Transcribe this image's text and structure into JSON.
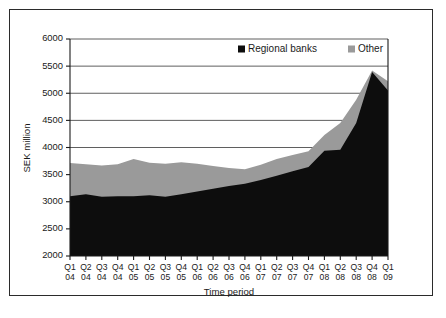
{
  "chart_data": {
    "type": "area",
    "stacked": true,
    "title": "",
    "subtitle": "",
    "xlabel": "Time period",
    "ylabel": "SEK million",
    "ylim": [
      2000,
      6000
    ],
    "ytick_step": 500,
    "yticks": [
      "2000",
      "2500",
      "3000",
      "3500",
      "4000",
      "4500",
      "5000",
      "5500",
      "6000"
    ],
    "grid": "horizontal",
    "legend_position": "top-right",
    "categories": [
      "Q1 04",
      "Q2 04",
      "Q3 04",
      "Q4 04",
      "Q1 05",
      "Q2 05",
      "Q3 05",
      "Q4 05",
      "Q1 06",
      "Q2 06",
      "Q3 06",
      "Q4 06",
      "Q1 07",
      "Q2 07",
      "Q3 07",
      "Q4 07",
      "Q1 08",
      "Q2 08",
      "Q3 08",
      "Q4 08",
      "Q1 09"
    ],
    "categories_quarter": [
      "Q1",
      "Q2",
      "Q3",
      "Q4",
      "Q1",
      "Q2",
      "Q3",
      "Q4",
      "Q1",
      "Q2",
      "Q3",
      "Q4",
      "Q1",
      "Q2",
      "Q3",
      "Q4",
      "Q1",
      "Q2",
      "Q3",
      "Q4",
      "Q1"
    ],
    "categories_year": [
      "04",
      "04",
      "04",
      "04",
      "05",
      "05",
      "05",
      "05",
      "06",
      "06",
      "06",
      "06",
      "07",
      "07",
      "07",
      "07",
      "08",
      "08",
      "08",
      "08",
      "09"
    ],
    "series": [
      {
        "name": "Regional banks",
        "color": "#0d0d0d",
        "values": [
          3100,
          3140,
          3090,
          3100,
          3100,
          3120,
          3090,
          3140,
          3190,
          3240,
          3290,
          3330,
          3400,
          3480,
          3560,
          3640,
          3940,
          3960,
          4450,
          5390,
          5050
        ]
      },
      {
        "name": "Other",
        "color": "#9a9a9a",
        "values": [
          615,
          550,
          580,
          590,
          690,
          600,
          610,
          590,
          510,
          420,
          330,
          270,
          280,
          310,
          300,
          290,
          290,
          490,
          430,
          30,
          170
        ]
      }
    ],
    "totals": [
      3715,
      3690,
      3670,
      3690,
      3790,
      3720,
      3700,
      3730,
      3700,
      3660,
      3620,
      3600,
      3680,
      3790,
      3860,
      3930,
      4230,
      4450,
      4880,
      5420,
      5220
    ]
  },
  "legend": {
    "items": [
      {
        "label": "Regional banks",
        "color": "#0d0d0d"
      },
      {
        "label": "Other",
        "color": "#9a9a9a"
      }
    ]
  },
  "colors": {
    "frame": "#2b2b2b",
    "grid": "#4d4d4d",
    "axis": "#1a1a1a",
    "background": "#ffffff"
  }
}
